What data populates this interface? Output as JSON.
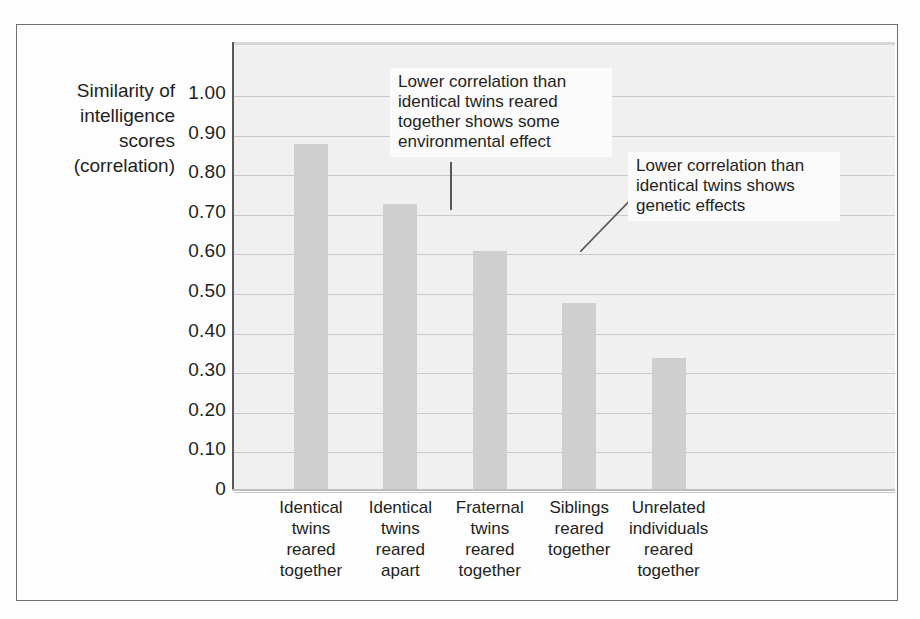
{
  "figure": {
    "axis_title": "Similarity of\nintelligence\nscores\n(correlation)",
    "axis_title_lines": [
      "Similarity of",
      "intelligence",
      "scores",
      "(correlation)"
    ],
    "annotations": [
      "Lower correlation than identical twins reared together shows some environmental effect",
      "Lower correlation than identical twins shows genetic effects"
    ],
    "colors": {
      "bar_fill": "#cfcfcf",
      "plot_background": "#f0f0f0",
      "gridline": "#c9c9c9",
      "axis_line": "#59595b",
      "frame": "#6f6f6f",
      "text": "#231f20"
    }
  },
  "chart_data": {
    "type": "bar",
    "title": "",
    "xlabel": "",
    "ylabel": "Similarity of intelligence scores (correlation)",
    "ylim": [
      0,
      1.05
    ],
    "grid": true,
    "legend": false,
    "ytick_labels": [
      "1.00",
      "0.90",
      "0.80",
      "0.70",
      "0.60",
      "0.50",
      "0.40",
      "0.30",
      "0.20",
      "0.10",
      "0"
    ],
    "ytick_values": [
      1.0,
      0.9,
      0.8,
      0.7,
      0.6,
      0.5,
      0.4,
      0.3,
      0.2,
      0.1,
      0
    ],
    "categories": [
      "Identical twins reared together",
      "Identical twins reared apart",
      "Fraternal twins reared together",
      "Siblings reared together",
      "Unrelated individuals reared together"
    ],
    "category_lines": [
      [
        "Identical",
        "twins",
        "reared",
        "together"
      ],
      [
        "Identical",
        "twins",
        "reared",
        "apart"
      ],
      [
        "Fraternal",
        "twins",
        "reared",
        "together"
      ],
      [
        "Siblings",
        "reared",
        "together"
      ],
      [
        "Unrelated",
        "individuals",
        "reared",
        "together"
      ]
    ],
    "values": [
      0.87,
      0.72,
      0.6,
      0.47,
      0.33
    ],
    "annotations": [
      {
        "text": "Lower correlation than identical twins reared together shows some environmental effect",
        "points_to_category": "Identical twins reared apart"
      },
      {
        "text": "Lower correlation than identical twins shows genetic effects",
        "points_to_category": "Fraternal twins reared together"
      }
    ]
  }
}
